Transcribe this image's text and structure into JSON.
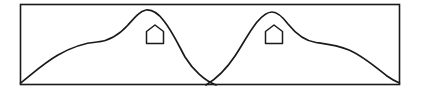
{
  "figure": {
    "type": "line-diagram",
    "background_color": "#ffffff",
    "canvas": {
      "width": 421,
      "height": 95
    },
    "frame": {
      "name": "figure-border",
      "x": 20.5,
      "y": 4.5,
      "width": 379,
      "height": 80,
      "stroke_color": "#1a1a1a",
      "stroke_width": 1.6
    },
    "curves": [
      {
        "id": "left-curve",
        "label": "left-bell-curve",
        "stroke_color": "#1a1a1a",
        "stroke_width": 1.7,
        "peak": {
          "x": 146,
          "y": 10
        },
        "shoulder": {
          "x": 96,
          "y": 42
        },
        "start": {
          "x": 20.5,
          "y": 83
        },
        "end": {
          "x": 216,
          "y": 85
        },
        "path": "M 20.5 83 C 32 74 44 63 58 55 C 72 47 84 43 97 42 C 110 41 119 35 128 25 C 135 17 140 11 146 10 C 152 9.4 158 13 164 21 C 172 31 178 44 185 57 C 193 70 205 81 216 85"
      },
      {
        "id": "right-curve",
        "label": "right-bell-curve",
        "stroke_color": "#1a1a1a",
        "stroke_width": 1.7,
        "peak": {
          "x": 272,
          "y": 12
        },
        "shoulder": {
          "x": 324,
          "y": 43
        },
        "start": {
          "x": 206,
          "y": 85
        },
        "end": {
          "x": 399.5,
          "y": 83
        },
        "path": "M 206 85 C 216 79 227 68 235 56 C 243 44 249 32 257 22 C 263 15 268 12 272 12 C 277 12 282 16 288 24 C 296 34 305 41 316 42.5 C 327 44 337 45 349 50 C 363 56 378 69 387 76 C 392 79.6 396 81.6 399.5 83"
      }
    ],
    "houses": [
      {
        "id": "house-left",
        "label": "house-symbol-left",
        "x": 145,
        "y": 26,
        "width": 20,
        "height": 18,
        "stroke_color": "#1a1a1a",
        "stroke_width": 1.5,
        "path": "M 146.5 43.5 L 146.5 31.5 L 155 25 L 163.5 31.5 L 163.5 43.5 Z"
      },
      {
        "id": "house-right",
        "label": "house-symbol-right",
        "x": 264,
        "y": 26,
        "width": 20,
        "height": 18,
        "stroke_color": "#1a1a1a",
        "stroke_width": 1.5,
        "path": "M 265.5 43.5 L 265.5 31.5 L 274 25 L 282.5 31.5 L 282.5 43.5 Z"
      }
    ]
  }
}
